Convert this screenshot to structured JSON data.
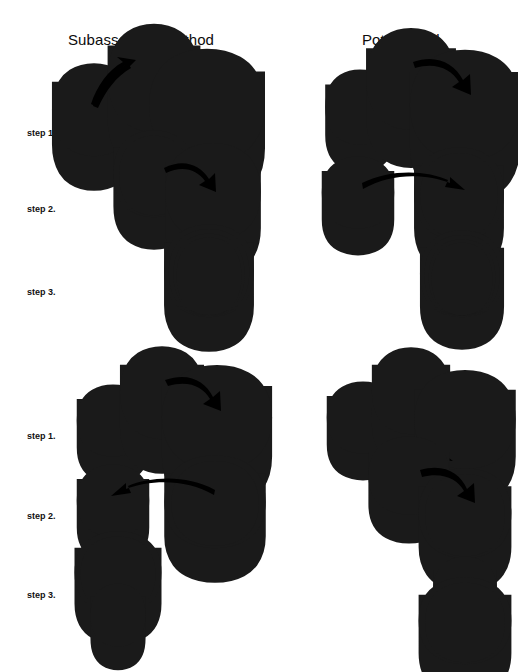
{
  "figure": {
    "title_left": "Subassembly method",
    "title_right": "Pot method",
    "alt_label_left": "or",
    "alt_label_right": "or",
    "step_labels": {
      "s1": "step 1.",
      "s2": "step 2.",
      "s3": "step 3.",
      "s1b": "step 1.",
      "s2b": "step 2.",
      "s3b": "step 3."
    },
    "ink_color": "#1a1a1a",
    "arrow_color": "#000000",
    "background_color": "#ffffff"
  },
  "diagram_data": {
    "type": "assembly-process-diagram",
    "description": "Line-art engineering diagram comparing two ceramic/part assembly methods. Each method is shown as a three-step sequence, plus an alternative sequence introduced by the word 'or'. Parts are drawn as isometric cylinders and rings; bold curved arrows indicate the motion of a part into position.",
    "columns": [
      {
        "name": "Subassembly method",
        "sequences": [
          {
            "variant": "primary",
            "steps": [
              {
                "label": "step 1.",
                "parts": [
                  {
                    "id": "small-cylinder",
                    "kind": "cylinder",
                    "size": "small"
                  },
                  {
                    "id": "medium-cylinder",
                    "kind": "cylinder",
                    "size": "medium"
                  },
                  {
                    "id": "large-cylinder",
                    "kind": "cylinder",
                    "size": "large"
                  }
                ],
                "arrows": [
                  {
                    "from": "small-cylinder",
                    "to": "medium-cylinder",
                    "direction": "up-right"
                  }
                ]
              },
              {
                "label": "step 2.",
                "parts": [
                  {
                    "id": "subassembly-ring",
                    "kind": "ring",
                    "size": "medium"
                  },
                  {
                    "id": "large-cylinder",
                    "kind": "cylinder",
                    "size": "large"
                  }
                ],
                "arrows": [
                  {
                    "from": "subassembly-ring",
                    "to": "large-cylinder",
                    "direction": "right-down"
                  }
                ]
              },
              {
                "label": "step 3.",
                "parts": [
                  {
                    "id": "final-assembly",
                    "kind": "nested-assembly",
                    "size": "large"
                  }
                ],
                "arrows": []
              }
            ]
          },
          {
            "variant": "or",
            "steps": [
              {
                "label": "step 1.",
                "parts": [
                  {
                    "id": "small-cylinder",
                    "kind": "cylinder",
                    "size": "small"
                  },
                  {
                    "id": "medium-cylinder",
                    "kind": "cylinder",
                    "size": "medium"
                  },
                  {
                    "id": "large-cylinder",
                    "kind": "cylinder",
                    "size": "large"
                  }
                ],
                "arrows": [
                  {
                    "from": "medium-cylinder",
                    "to": "large-cylinder",
                    "direction": "right-down"
                  }
                ]
              },
              {
                "label": "step 2.",
                "parts": [
                  {
                    "id": "small-cylinder",
                    "kind": "cylinder",
                    "size": "small"
                  },
                  {
                    "id": "large-ring",
                    "kind": "ring",
                    "size": "large"
                  }
                ],
                "arrows": [
                  {
                    "from": "large-ring",
                    "to": "small-cylinder",
                    "direction": "left"
                  }
                ]
              },
              {
                "label": "step 3.",
                "parts": [
                  {
                    "id": "stacked-assembly",
                    "kind": "stacked-assembly",
                    "size": "large-over-small"
                  }
                ],
                "arrows": []
              }
            ]
          }
        ]
      },
      {
        "name": "Pot method",
        "sequences": [
          {
            "variant": "primary",
            "steps": [
              {
                "label": "step 1.",
                "parts": [
                  {
                    "id": "small-cylinder",
                    "kind": "cylinder",
                    "size": "small"
                  },
                  {
                    "id": "medium-cylinder",
                    "kind": "cylinder",
                    "size": "medium"
                  },
                  {
                    "id": "large-cylinder",
                    "kind": "cylinder",
                    "size": "large"
                  }
                ],
                "arrows": [
                  {
                    "from": "medium-cylinder",
                    "to": "large-cylinder",
                    "direction": "right-down"
                  }
                ]
              },
              {
                "label": "step 2.",
                "parts": [
                  {
                    "id": "small-cylinder",
                    "kind": "cylinder",
                    "size": "small"
                  },
                  {
                    "id": "large-ring",
                    "kind": "ring",
                    "size": "large"
                  }
                ],
                "arrows": [
                  {
                    "from": "small-cylinder",
                    "to": "large-ring",
                    "direction": "right"
                  }
                ]
              },
              {
                "label": "step 3.",
                "parts": [
                  {
                    "id": "final-assembly",
                    "kind": "nested-assembly",
                    "size": "large"
                  }
                ],
                "arrows": []
              }
            ]
          },
          {
            "variant": "or",
            "steps": [
              {
                "label": "step 1.",
                "parts": [
                  {
                    "id": "small-cylinder",
                    "kind": "cylinder",
                    "size": "small"
                  },
                  {
                    "id": "medium-cylinder",
                    "kind": "cylinder",
                    "size": "medium"
                  },
                  {
                    "id": "large-cylinder",
                    "kind": "cylinder",
                    "size": "large"
                  }
                ],
                "arrows": [
                  {
                    "from": "small-cylinder",
                    "to": "large-cylinder",
                    "direction": "right"
                  }
                ]
              },
              {
                "label": "step 2.",
                "parts": [
                  {
                    "id": "medium-cylinder",
                    "kind": "cylinder",
                    "size": "medium"
                  },
                  {
                    "id": "ring-with-insert",
                    "kind": "ring-with-insert",
                    "size": "large"
                  }
                ],
                "arrows": [
                  {
                    "from": "medium-cylinder",
                    "to": "ring-with-insert",
                    "direction": "right-down"
                  }
                ]
              },
              {
                "label": "step 3.",
                "parts": [
                  {
                    "id": "stacked-assembly",
                    "kind": "stacked-assembly",
                    "size": "small-over-large"
                  }
                ],
                "arrows": []
              }
            ]
          }
        ]
      }
    ]
  }
}
